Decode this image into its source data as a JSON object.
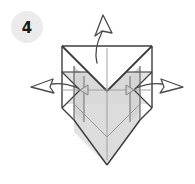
{
  "figure": {
    "kind": "origami-step-diagram",
    "width": 195,
    "height": 184,
    "background_color": "#ffffff"
  },
  "step_badge": {
    "number": "4",
    "circle_color": "#ebebeb",
    "text_color": "#1a1a1a",
    "center_x": 27,
    "center_y": 27,
    "radius": 16
  },
  "model": {
    "name": "folded-paper-model",
    "paper_front_color": "#e2e2e2",
    "paper_shadow_color": "#cfcfcf",
    "paper_highlight_color": "#f2f2f2",
    "outline_color": "#3c3c3c",
    "crease_color": "#8a8a8a",
    "outline_width": 1.3
  },
  "arrows": [
    {
      "name": "arrow-up",
      "label": "pull up",
      "direction": "up",
      "head_x": 104,
      "head_y": 17,
      "tail_x": 97,
      "tail_y": 63,
      "color": "#4a4a4a"
    },
    {
      "name": "arrow-left",
      "label": "pull left",
      "direction": "left",
      "head_x": 37,
      "head_y": 86,
      "tail_x": 76,
      "tail_y": 88,
      "color": "#4a4a4a"
    },
    {
      "name": "arrow-right",
      "label": "pull right",
      "direction": "right",
      "head_x": 176,
      "head_y": 86,
      "tail_x": 140,
      "tail_y": 88,
      "color": "#4a4a4a"
    }
  ],
  "caption": {
    "text": "",
    "color": "#d8d8d8"
  }
}
